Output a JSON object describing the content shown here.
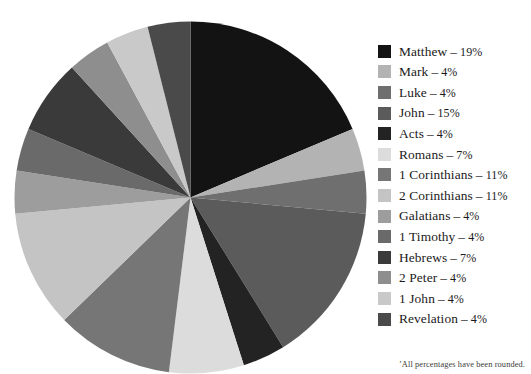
{
  "chart_data": {
    "type": "pie",
    "title": "",
    "subtitle": "",
    "xlabel": "",
    "ylabel": "",
    "legend_position": "right",
    "grid": false,
    "start_angle_deg": 0,
    "direction": "clockwise",
    "units": "percent",
    "categories": [
      "Matthew",
      "Mark",
      "Luke",
      "John",
      "Acts",
      "Romans",
      "1 Corinthians",
      "2 Corinthians",
      "Galatians",
      "1 Timothy",
      "Hebrews",
      "2 Peter",
      "1 John",
      "Revelation"
    ],
    "values": [
      19,
      4,
      4,
      15,
      4,
      7,
      11,
      11,
      4,
      4,
      7,
      4,
      4,
      4
    ],
    "colors": [
      "#131313",
      "#b3b3b3",
      "#6f6f6f",
      "#5b5b5b",
      "#232323",
      "#dcdcdc",
      "#767676",
      "#c4c4c4",
      "#9d9d9d",
      "#6a6a6a",
      "#3a3a3a",
      "#8e8e8e",
      "#c9c9c9",
      "#4a4a4a"
    ],
    "annotations": [
      "’All percentages have been rounded."
    ]
  },
  "legend": {
    "separator": "–",
    "items": [
      {
        "label": "Matthew",
        "value": "19%",
        "color": "#131313"
      },
      {
        "label": "Mark",
        "value": "4%",
        "color": "#b3b3b3"
      },
      {
        "label": "Luke",
        "value": "4%",
        "color": "#6f6f6f"
      },
      {
        "label": "John",
        "value": "15%",
        "color": "#5b5b5b"
      },
      {
        "label": "Acts",
        "value": "4%",
        "color": "#232323"
      },
      {
        "label": "Romans",
        "value": "7%",
        "color": "#dcdcdc"
      },
      {
        "label": "1 Corinthians",
        "value": "11%",
        "color": "#767676"
      },
      {
        "label": "2 Corinthians",
        "value": "11%",
        "color": "#c4c4c4"
      },
      {
        "label": "Galatians",
        "value": "4%",
        "color": "#9d9d9d"
      },
      {
        "label": "1 Timothy",
        "value": "4%",
        "color": "#6a6a6a"
      },
      {
        "label": "Hebrews",
        "value": "7%",
        "color": "#3a3a3a"
      },
      {
        "label": "2 Peter",
        "value": "4%",
        "color": "#8e8e8e"
      },
      {
        "label": "1 John",
        "value": "4%",
        "color": "#c9c9c9"
      },
      {
        "label": "Revelation",
        "value": "4%",
        "color": "#4a4a4a"
      }
    ]
  },
  "footnote": {
    "text": "’All percentages have been rounded."
  }
}
